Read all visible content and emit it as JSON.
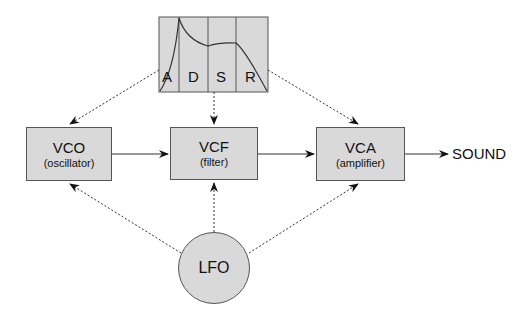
{
  "diagram": {
    "envelope": {
      "name": "ADSR envelope",
      "stages": [
        "A",
        "D",
        "S",
        "R"
      ]
    },
    "modules": [
      {
        "id": "vco",
        "title": "VCO",
        "subtitle": "(oscillator)"
      },
      {
        "id": "vcf",
        "title": "VCF",
        "subtitle": "(filter)"
      },
      {
        "id": "vca",
        "title": "VCA",
        "subtitle": "(amplifier)"
      }
    ],
    "output": "SOUND",
    "modulator": "LFO",
    "colors": {
      "fill": "#d9d9d9",
      "stroke": "#555555",
      "line": "#333333"
    },
    "connections": [
      {
        "from": "VCO",
        "to": "VCF",
        "style": "solid"
      },
      {
        "from": "VCF",
        "to": "VCA",
        "style": "solid"
      },
      {
        "from": "VCA",
        "to": "SOUND",
        "style": "solid"
      },
      {
        "from": "ADSR",
        "to": "VCO",
        "style": "dotted"
      },
      {
        "from": "ADSR",
        "to": "VCF",
        "style": "dotted"
      },
      {
        "from": "ADSR",
        "to": "VCA",
        "style": "dotted"
      },
      {
        "from": "LFO",
        "to": "VCO",
        "style": "dotted"
      },
      {
        "from": "LFO",
        "to": "VCF",
        "style": "dotted"
      },
      {
        "from": "LFO",
        "to": "VCA",
        "style": "dotted"
      }
    ]
  }
}
